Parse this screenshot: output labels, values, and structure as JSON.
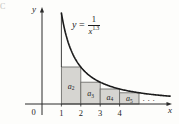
{
  "figure": {
    "corner_fragment": "C",
    "equation": {
      "lhs": "y",
      "rel": "=",
      "numerator": "1",
      "denominator_base": "x",
      "denominator_exponent": "1.3"
    }
  },
  "chart_data": {
    "type": "line",
    "title": "",
    "xlabel": "x",
    "ylabel": "y",
    "origin_label": "0",
    "x_ticks": [
      1,
      2,
      3,
      4
    ],
    "grid": false,
    "legend": false,
    "axis_arrows": true,
    "curve": {
      "expression": "y = 1/x^1.3",
      "exponent": 1.3,
      "x_start": 1,
      "x_end": 6.6
    },
    "rectangles": [
      {
        "label": "a",
        "subscript": "2",
        "x0": 1,
        "x1": 2,
        "height": 0.4061
      },
      {
        "label": "a",
        "subscript": "3",
        "x0": 2,
        "x1": 3,
        "height": 0.2397
      },
      {
        "label": "a",
        "subscript": "4",
        "x0": 3,
        "x1": 4,
        "height": 0.1649
      },
      {
        "label": "a",
        "subscript": "5",
        "x0": 4,
        "x1": 5,
        "height": 0.1235
      }
    ],
    "ellipsis": "· · ·",
    "colors": {
      "rect_fill": "#d6d5d1",
      "rect_stroke": "#6f6f6c",
      "curve": "#1b1b1b",
      "axis": "#2b2b2b",
      "text": "#1f1f1f"
    }
  }
}
